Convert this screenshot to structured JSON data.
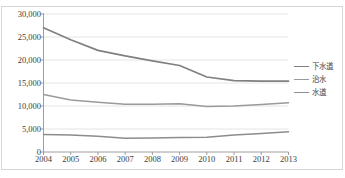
{
  "chart_data": {
    "type": "line",
    "title": "",
    "xlabel": "",
    "ylabel": "",
    "categories": [
      "2004",
      "2005",
      "2006",
      "2007",
      "2008",
      "2009",
      "2010",
      "2011",
      "2012",
      "2013"
    ],
    "ylim": [
      0,
      30000
    ],
    "ytick_labels": [
      "0",
      "5,000",
      "10,000",
      "15,000",
      "20,000",
      "25,000",
      "30,000"
    ],
    "ytick_values": [
      0,
      5000,
      10000,
      15000,
      20000,
      25000,
      30000
    ],
    "grid": true,
    "legend_position": "right",
    "series": [
      {
        "name": "下水道",
        "color": "#808080",
        "values": [
          27000,
          24400,
          22100,
          20900,
          19800,
          18800,
          16300,
          15500,
          15400,
          15400
        ]
      },
      {
        "name": "治水",
        "color": "#9a9a9a",
        "values": [
          12500,
          11300,
          10800,
          10400,
          10400,
          10500,
          9900,
          10000,
          10300,
          10700
        ]
      },
      {
        "name": "水道",
        "color": "#8c8c8c",
        "values": [
          3800,
          3700,
          3400,
          3000,
          3050,
          3150,
          3200,
          3700,
          4000,
          4400
        ]
      }
    ]
  },
  "ghost": {
    "top": "",
    "bottom": ""
  }
}
